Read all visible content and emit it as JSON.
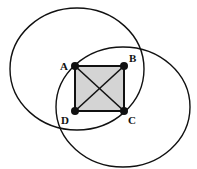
{
  "diagram": {
    "title": "",
    "square": {
      "fill": "#d4d4d4",
      "vertices": {
        "A": {
          "label": "A",
          "x": 75,
          "y": 66
        },
        "B": {
          "label": "B",
          "x": 124,
          "y": 66
        },
        "C": {
          "label": "C",
          "x": 124,
          "y": 111
        },
        "D": {
          "label": "D",
          "x": 75,
          "y": 111
        }
      },
      "diagonals": [
        "AC",
        "BD"
      ]
    },
    "circles": [
      {
        "name": "circle-centered-A",
        "cx": 77,
        "cy": 69,
        "rx": 67,
        "ry": 61
      },
      {
        "name": "circle-centered-C",
        "cx": 123,
        "cy": 107,
        "rx": 67,
        "ry": 60
      }
    ],
    "labels": {
      "A": "A",
      "B": "B",
      "C": "C",
      "D": "D"
    },
    "stroke_color": "#111111"
  }
}
